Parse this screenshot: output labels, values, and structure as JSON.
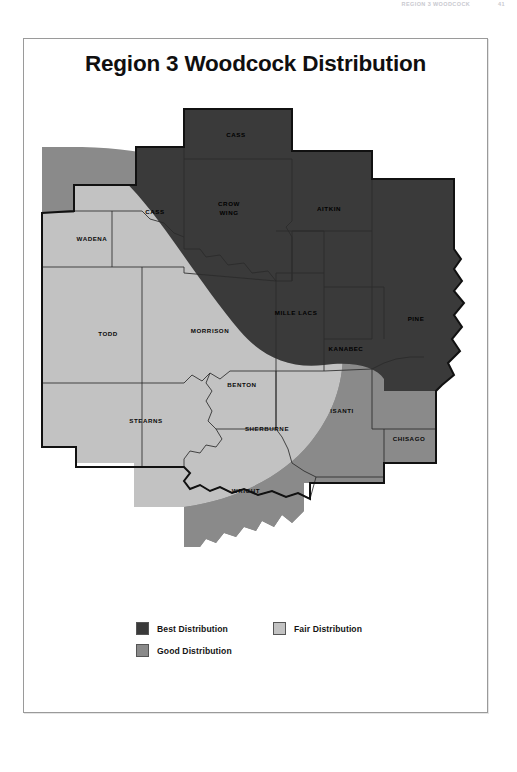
{
  "running_header": {
    "text": "REGION 3 WOODCOCK",
    "page": "41"
  },
  "figure": {
    "title": "Region 3 Woodcock Distribution"
  },
  "colors": {
    "best": "#3a3a3a",
    "good": "#8a8a8a",
    "fair": "#c2c2c2",
    "outline": "#1a1a1a",
    "county_line": "#2b2b2b",
    "frame": "#9a9a9a",
    "page_background": "#ffffff"
  },
  "legend": {
    "items": [
      {
        "key": "best",
        "label": "Best Distribution",
        "swatch": "#3a3a3a"
      },
      {
        "key": "fair",
        "label": "Fair Distribution",
        "swatch": "#c2c2c2"
      },
      {
        "key": "good",
        "label": "Good Distribution",
        "swatch": "#8a8a8a"
      }
    ]
  },
  "map": {
    "region": "Region 3",
    "counties": [
      {
        "name": "CASS",
        "label": "CASS",
        "x": 212,
        "y": 44,
        "distribution": "best"
      },
      {
        "name": "CASS_SW",
        "label": "CASS",
        "x": 131,
        "y": 121,
        "distribution": "best"
      },
      {
        "name": "CROW WING",
        "label": "CROW",
        "x": 205,
        "y": 114,
        "line2": "WING",
        "distribution": "best"
      },
      {
        "name": "AITKIN",
        "label": "AITKIN",
        "x": 305,
        "y": 118,
        "distribution": "best"
      },
      {
        "name": "WADENA",
        "label": "WADENA",
        "x": 68,
        "y": 148,
        "distribution": "good"
      },
      {
        "name": "TODD",
        "label": "TODD",
        "x": 84,
        "y": 243,
        "distribution": "fair"
      },
      {
        "name": "MORRISON",
        "label": "MORRISON",
        "x": 186,
        "y": 240,
        "distribution": "good"
      },
      {
        "name": "MILLE LACS",
        "label": "MILLE LACS",
        "x": 272,
        "y": 222,
        "distribution": "best"
      },
      {
        "name": "KANABEC",
        "label": "KANABEC",
        "x": 322,
        "y": 258,
        "distribution": "best"
      },
      {
        "name": "PINE",
        "label": "PINE",
        "x": 392,
        "y": 228,
        "distribution": "best"
      },
      {
        "name": "BENTON",
        "label": "BENTON",
        "x": 218,
        "y": 294,
        "distribution": "fair"
      },
      {
        "name": "STEARNS",
        "label": "STEARNS",
        "x": 122,
        "y": 330,
        "distribution": "fair"
      },
      {
        "name": "SHERBURNE",
        "label": "SHERBURNE",
        "x": 243,
        "y": 338,
        "distribution": "fair"
      },
      {
        "name": "ISANTI",
        "label": "ISANTI",
        "x": 318,
        "y": 320,
        "distribution": "good"
      },
      {
        "name": "CHISAGO",
        "label": "CHISAGO",
        "x": 385,
        "y": 348,
        "distribution": "good"
      },
      {
        "name": "WRIGHT",
        "label": "WRIGHT",
        "x": 222,
        "y": 400,
        "distribution": "fair"
      }
    ]
  }
}
